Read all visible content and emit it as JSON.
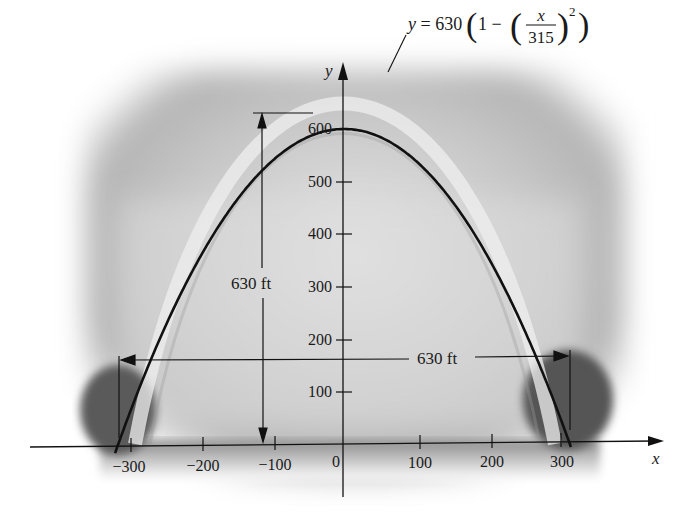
{
  "figure": {
    "equation": {
      "lhs": "y = 630",
      "one": "1 −",
      "num": "x",
      "den": "315",
      "exp": "2"
    },
    "axis_x_label": "x",
    "axis_y_label": "y",
    "x_ticks": [
      "−300",
      "−200",
      "−100",
      "0",
      "100",
      "200",
      "300"
    ],
    "y_ticks": [
      "100",
      "200",
      "300",
      "400",
      "500",
      "600"
    ],
    "height_dimension": "630 ft",
    "width_dimension": "630 ft"
  },
  "chart_data": {
    "type": "line",
    "title": "",
    "equation": "y = 630(1 - (x/315)^2)",
    "xlabel": "x",
    "ylabel": "y",
    "xlim": [
      -330,
      330
    ],
    "ylim": [
      0,
      650
    ],
    "x_ticks": [
      -300,
      -200,
      -100,
      0,
      100,
      200,
      300
    ],
    "y_ticks": [
      100,
      200,
      300,
      400,
      500,
      600
    ],
    "series": [
      {
        "name": "y = 630(1 - (x/315)^2)",
        "x": [
          -315,
          -300,
          -250,
          -200,
          -150,
          -100,
          -50,
          0,
          50,
          100,
          150,
          200,
          250,
          300,
          315
        ],
        "y": [
          0,
          60.5,
          233,
          376,
          487,
          567,
          614,
          630,
          614,
          567,
          487,
          376,
          233,
          60.5,
          0
        ]
      }
    ],
    "annotations": [
      "630 ft (height)",
      "630 ft (width)"
    ],
    "grid": false,
    "legend": "none"
  }
}
